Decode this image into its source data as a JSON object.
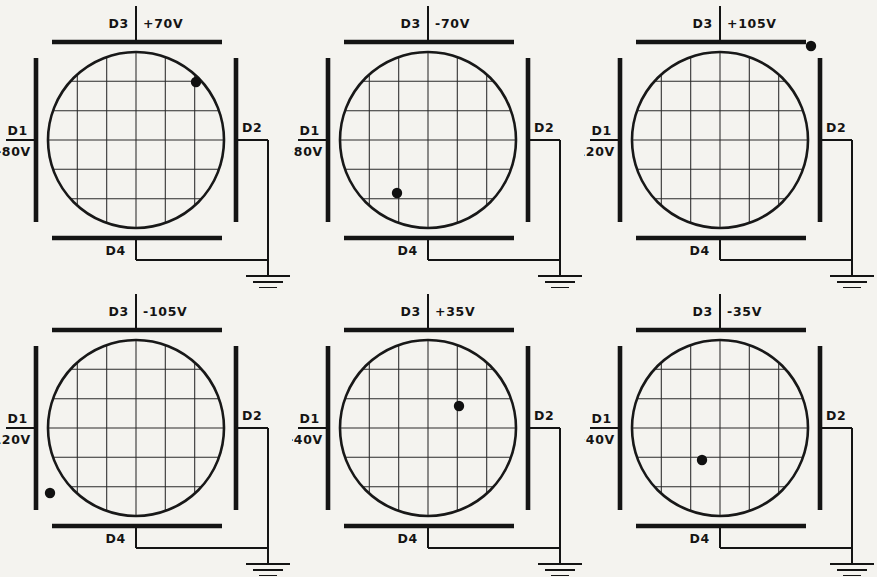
{
  "figure": {
    "plate_labels": {
      "left": "D1",
      "right": "D2",
      "top": "D3",
      "bottom": "D4"
    },
    "ground_symbol": "earth-ground"
  },
  "panels": [
    {
      "id": "panel-1",
      "top_label": "D3",
      "top_voltage": "+70V",
      "left_label": "D1",
      "left_voltage": "-80V",
      "right_label": "D2",
      "bottom_label": "D4",
      "spot": {
        "x": 196,
        "y": 82,
        "location": "upper-right on circle edge"
      }
    },
    {
      "id": "panel-2",
      "top_label": "D3",
      "top_voltage": "-70V",
      "left_label": "D1",
      "left_voltage": "+80V",
      "right_label": "D2",
      "bottom_label": "D4",
      "spot": {
        "x": 105,
        "y": 193,
        "location": "lower-left on circle edge"
      }
    },
    {
      "id": "panel-3",
      "top_label": "D3",
      "top_voltage": "+105V",
      "left_label": "D1",
      "left_voltage": "-120V",
      "right_label": "D2",
      "bottom_label": "D4",
      "spot": {
        "x": 227,
        "y": 46,
        "location": "outside circle, upper-right"
      }
    },
    {
      "id": "panel-4",
      "top_label": "D3",
      "top_voltage": "-105V",
      "left_label": "D1",
      "left_voltage": "+120V",
      "right_label": "D2",
      "bottom_label": "D4",
      "spot": {
        "x": 50,
        "y": 205,
        "location": "outside circle, lower-left"
      }
    },
    {
      "id": "panel-5",
      "top_label": "D3",
      "top_voltage": "+35V",
      "left_label": "D1",
      "left_voltage": "-40V",
      "right_label": "D2",
      "bottom_label": "D4",
      "spot": {
        "x": 167,
        "y": 118,
        "location": "right of center, above center"
      }
    },
    {
      "id": "panel-6",
      "top_label": "D3",
      "top_voltage": "-35V",
      "left_label": "D1",
      "left_voltage": "+40V",
      "right_label": "D2",
      "bottom_label": "D4",
      "spot": {
        "x": 118,
        "y": 172,
        "location": "left of center, below center"
      }
    }
  ]
}
